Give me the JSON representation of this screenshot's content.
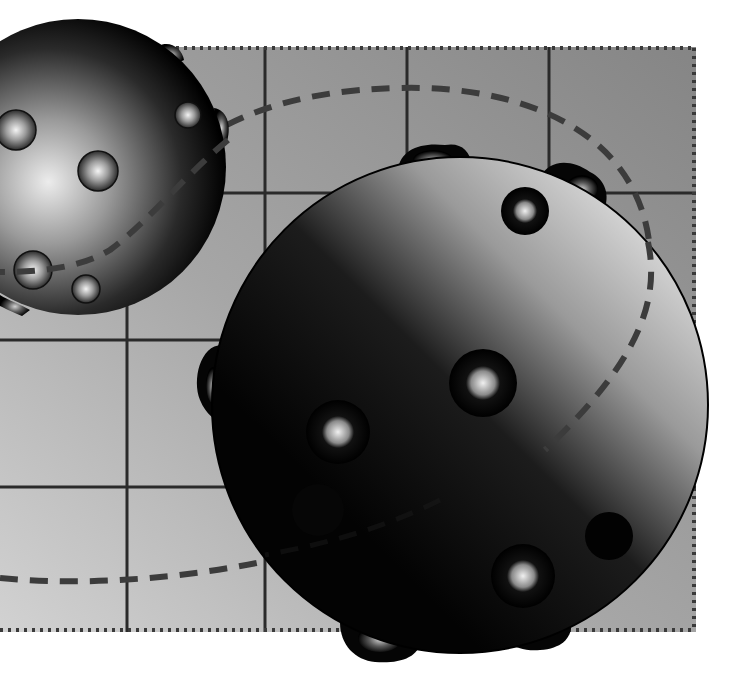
{
  "illustration": {
    "description": "Grayscale 3D illustration of two studded spheres over a gridded panel with a dashed orbit path",
    "canvas": {
      "width": 732,
      "height": 680,
      "background": "#ffffff"
    },
    "panel": {
      "x": 0,
      "y": 47,
      "width": 696,
      "height": 585,
      "gradient": {
        "top_right": "#858585",
        "bottom_left": "#cfcfcf"
      },
      "border_style": "dotted",
      "border_color": "#3a3a3a",
      "grid_color": "#2a2a2a",
      "vertical_lines_x": [
        127,
        265,
        407,
        549
      ],
      "horizontal_lines_y": [
        193,
        340,
        487
      ]
    },
    "orbit_path": {
      "style": "dashed",
      "color": "#3c3c3c",
      "width": 6
    },
    "spheres": [
      {
        "name": "small-sphere",
        "cx": 78,
        "cy": 167,
        "r": 148,
        "highlight": "#e8e8e8",
        "shadow": "#000000",
        "studs": [
          {
            "cx": 16,
            "cy": 130,
            "r": 20
          },
          {
            "cx": 98,
            "cy": 171,
            "r": 20
          },
          {
            "cx": 188,
            "cy": 115,
            "r": 13
          },
          {
            "cx": 33,
            "cy": 270,
            "r": 19
          },
          {
            "cx": 86,
            "cy": 289,
            "r": 14
          }
        ]
      },
      {
        "name": "large-sphere",
        "cx": 460,
        "cy": 405,
        "r": 248,
        "highlight": "#d6d6d6",
        "shadow": "#050505",
        "studs": [
          {
            "cx": 525,
            "cy": 211,
            "r": 24
          },
          {
            "cx": 483,
            "cy": 383,
            "r": 34
          },
          {
            "cx": 338,
            "cy": 432,
            "r": 32
          },
          {
            "cx": 523,
            "cy": 576,
            "r": 32
          },
          {
            "cx": 609,
            "cy": 536,
            "r": 24,
            "dark": true
          }
        ]
      }
    ]
  }
}
